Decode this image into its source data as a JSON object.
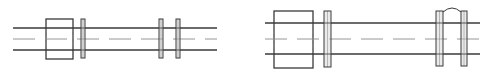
{
  "colors": {
    "background": "#ffffff",
    "stroke": "#3a3a3a",
    "centerline": "#8a8a8a",
    "flange_fill": "#d8d8d8"
  },
  "diagrams": [
    {
      "name": "shaft-assembly-left",
      "pipe": {
        "x1": 13,
        "x2": 217,
        "y_top": 28,
        "y_bottom": 50,
        "y_center": 39
      },
      "block": {
        "x": 46,
        "y": 19,
        "w": 27,
        "h": 40
      },
      "flanges": [
        {
          "x": 81,
          "y": 19,
          "w": 4,
          "h": 39
        },
        {
          "x": 159,
          "y": 19,
          "w": 4,
          "h": 39
        },
        {
          "x": 176,
          "y": 19,
          "w": 4,
          "h": 39
        }
      ],
      "arc": null
    },
    {
      "name": "shaft-assembly-right",
      "pipe": {
        "x1": 265,
        "x2": 480,
        "y_top": 23,
        "y_bottom": 54,
        "y_center": 39
      },
      "block": {
        "x": 274,
        "y": 11,
        "w": 39,
        "h": 57
      },
      "flanges": [
        {
          "x": 324,
          "y": 11,
          "w": 7,
          "h": 56
        },
        {
          "x": 436,
          "y": 11,
          "w": 7,
          "h": 55
        },
        {
          "x": 461,
          "y": 11,
          "w": 6,
          "h": 55
        }
      ],
      "arc": {
        "x1": 443,
        "x2": 461,
        "y": 12,
        "peak": 7
      }
    }
  ]
}
